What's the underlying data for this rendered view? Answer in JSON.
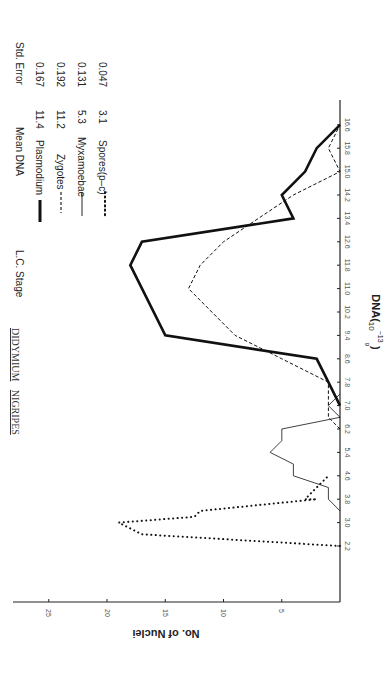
{
  "chart_data": {
    "type": "line",
    "orientation": "rotated-90-clockwise",
    "title": "DIDYMIUM NIGRIPES",
    "xlabel": "DNA(10^-13 g)",
    "ylabel": "No. of Nuclei",
    "x_ticks": [
      "2.2",
      "3.0",
      "3.8",
      "4.6",
      "5.4",
      "6.2",
      "7.0",
      "7.8",
      "8.6",
      "9.4",
      "10.2",
      "11.0",
      "11.8",
      "12.6",
      "13.4",
      "14.2",
      "15.0",
      "15.8",
      "16.6"
    ],
    "y_ticks": [
      "5",
      "10",
      "15",
      "20",
      "25"
    ],
    "xlim": [
      2.2,
      16.6
    ],
    "ylim": [
      0,
      28
    ],
    "grid": false,
    "legend_position": "top-right (rotated)",
    "legend_columns": [
      "L.C. Stage",
      "Mean DNA",
      "Std. Error"
    ],
    "series": [
      {
        "name": "Plasmodium",
        "style": "thick-solid",
        "mean_dna": "11.4",
        "std_error": "0.167",
        "points": [
          [
            7.0,
            0
          ],
          [
            7.8,
            1
          ],
          [
            8.6,
            2
          ],
          [
            9.4,
            15
          ],
          [
            11.8,
            18
          ],
          [
            12.6,
            17
          ],
          [
            13.4,
            4
          ],
          [
            14.2,
            5
          ],
          [
            15.0,
            3
          ],
          [
            15.8,
            2
          ],
          [
            16.6,
            0
          ]
        ]
      },
      {
        "name": "Zygotes",
        "style": "dashed",
        "mean_dna": "11.2",
        "std_error": "0.192",
        "points": [
          [
            6.2,
            0
          ],
          [
            6.6,
            1
          ],
          [
            7.0,
            1
          ],
          [
            7.8,
            1
          ],
          [
            8.6,
            5
          ],
          [
            9.4,
            9
          ],
          [
            11.0,
            13
          ],
          [
            11.8,
            12
          ],
          [
            12.6,
            10
          ],
          [
            13.4,
            7
          ],
          [
            14.2,
            4
          ],
          [
            15.0,
            0
          ],
          [
            15.8,
            1
          ],
          [
            16.6,
            0
          ]
        ]
      },
      {
        "name": "Myxamoebae",
        "style": "thin-solid",
        "mean_dna": "5.3",
        "std_error": "0.131",
        "points": [
          [
            3.4,
            0
          ],
          [
            3.8,
            1
          ],
          [
            4.2,
            1
          ],
          [
            4.6,
            4
          ],
          [
            5.0,
            4
          ],
          [
            5.4,
            6
          ],
          [
            5.8,
            5
          ],
          [
            6.2,
            5
          ],
          [
            6.6,
            0
          ],
          [
            7.0,
            1
          ],
          [
            7.4,
            0
          ]
        ]
      },
      {
        "name": "Spores(p–c)",
        "style": "dotted",
        "mean_dna": "3.1",
        "std_error": "0.047",
        "points": [
          [
            2.2,
            0
          ],
          [
            2.6,
            17
          ],
          [
            2.8,
            18
          ],
          [
            3.0,
            19
          ],
          [
            3.2,
            12.5
          ],
          [
            3.4,
            12
          ],
          [
            3.8,
            2
          ],
          [
            3.8,
            3
          ],
          [
            4.2,
            2
          ],
          [
            4.6,
            1
          ]
        ]
      }
    ]
  },
  "title": {
    "genus": "DIDYMIUM",
    "species": "NIGRIPES"
  },
  "legend": {
    "headers": {
      "stage": "L.C. Stage",
      "mean": "Mean DNA",
      "err": "Std. Error"
    },
    "rows": [
      {
        "label": "Plasmodium",
        "mean": "11.4",
        "err": "0.167"
      },
      {
        "label": "Zygotes",
        "mean": "11.2",
        "err": "0.192"
      },
      {
        "label": "Myxamoebae",
        "mean": "5.3",
        "err": "0.131"
      },
      {
        "label": "Spores(p–c)",
        "mean": "3.1",
        "err": "0.047"
      }
    ]
  },
  "axes": {
    "x_label_main": "DNA(",
    "x_label_base": "10",
    "x_label_exp": "−13",
    "x_label_unit": "g",
    "x_label_close": ")",
    "y_label": "No. of Nuclei"
  }
}
